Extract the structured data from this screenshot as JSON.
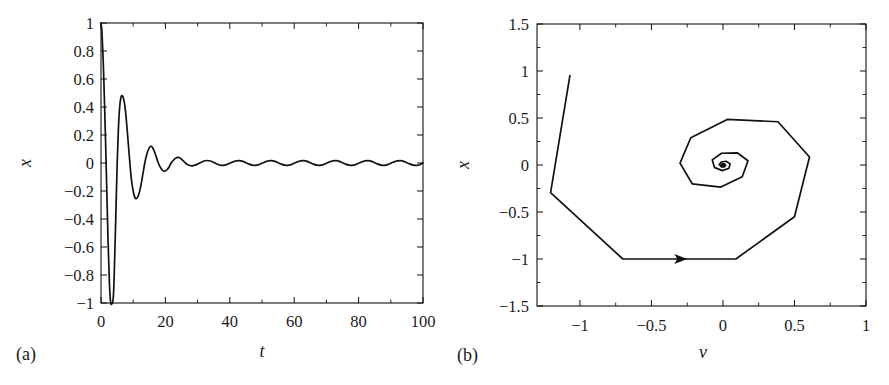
{
  "figure": {
    "background": "#ffffff",
    "line_color": "#111111",
    "text_color": "#1a1a1a"
  },
  "panels": [
    {
      "key": "a",
      "label": "(a)",
      "xlabel": "t",
      "ylabel": "x"
    },
    {
      "key": "b",
      "label": "(b)",
      "xlabel": "ν",
      "ylabel": "x"
    }
  ],
  "chart_data": [
    {
      "type": "line",
      "panel": "(a)",
      "title": "",
      "xlabel": "t",
      "ylabel": "x",
      "xlim": [
        0,
        100
      ],
      "ylim": [
        -1,
        1
      ],
      "xticks": [
        0,
        20,
        40,
        60,
        80,
        100
      ],
      "xticklabels": [
        "0",
        "20",
        "40",
        "60",
        "80",
        "100"
      ],
      "xminorticks": [
        10,
        30,
        50,
        70,
        90
      ],
      "yticks": [
        1,
        0.8,
        0.6,
        0.4,
        0.2,
        0,
        -0.2,
        -0.4,
        -0.6,
        -0.8,
        -1
      ],
      "yticklabels": [
        "1",
        "0.8",
        "0.6",
        "0.4",
        "0.2",
        "0",
        "−0.2",
        "−0.4",
        "−0.6",
        "−0.8",
        "−1"
      ],
      "grid": false,
      "legend": "none",
      "series": [
        {
          "name": "x(t)",
          "color": "#111111",
          "x": [
            0.0,
            0.3,
            0.7,
            1.0,
            1.4,
            1.8,
            2.2,
            2.6,
            3.0,
            3.3,
            3.6,
            3.9,
            4.2,
            4.6,
            5.0,
            5.4,
            5.8,
            6.2,
            6.6,
            7.0,
            7.4,
            7.9,
            8.4,
            8.9,
            9.4,
            10.0,
            10.6,
            11.2,
            11.8,
            12.4,
            13.0,
            13.6,
            14.2,
            14.8,
            15.4,
            16.0,
            16.6,
            17.2,
            17.8,
            18.4,
            19.0,
            19.7,
            20.4,
            21.1,
            21.8,
            22.5,
            23.2,
            23.9,
            24.6,
            25.3,
            26.0,
            26.8,
            27.6,
            28.4,
            29.2,
            30.0,
            31.0,
            32.0,
            33.0,
            34.0,
            35.0,
            36.0,
            37.0,
            38.0,
            39.0,
            40.0,
            41.0,
            42.0,
            43.0,
            44.0,
            45.0,
            46.0,
            47.0,
            48.0,
            49.0,
            50.0,
            51.0,
            52.0,
            53.0,
            54.0,
            55.0,
            56.0,
            57.0,
            58.0,
            59.0,
            60.0,
            61.0,
            62.0,
            63.0,
            64.0,
            65.0,
            66.0,
            67.0,
            68.0,
            69.0,
            70.0,
            71.0,
            72.0,
            73.0,
            74.0,
            75.0,
            76.0,
            77.0,
            78.0,
            79.0,
            80.0,
            81.0,
            82.0,
            83.0,
            84.0,
            85.0,
            86.0,
            87.0,
            88.0,
            89.0,
            90.0,
            91.0,
            92.0,
            93.0,
            94.0,
            95.0,
            96.0,
            97.0,
            98.0,
            99.0,
            100.0
          ],
          "y": [
            1.0,
            0.93,
            0.72,
            0.5,
            0.17,
            -0.2,
            -0.56,
            -0.85,
            -1.0,
            -1.0,
            -1.0,
            -0.93,
            -0.72,
            -0.38,
            -0.02,
            0.24,
            0.4,
            0.47,
            0.48,
            0.46,
            0.41,
            0.3,
            0.16,
            0.02,
            -0.11,
            -0.2,
            -0.25,
            -0.25,
            -0.22,
            -0.16,
            -0.08,
            0.0,
            0.06,
            0.1,
            0.12,
            0.11,
            0.08,
            0.04,
            0.0,
            -0.03,
            -0.05,
            -0.06,
            -0.05,
            -0.03,
            0.0,
            0.02,
            0.035,
            0.04,
            0.035,
            0.02,
            0.005,
            -0.01,
            -0.018,
            -0.02,
            -0.015,
            -0.008,
            0.004,
            0.014,
            0.018,
            0.014,
            0.004,
            -0.007,
            -0.015,
            -0.017,
            -0.012,
            -0.002,
            0.008,
            0.015,
            0.017,
            0.012,
            0.002,
            -0.008,
            -0.015,
            -0.017,
            -0.012,
            -0.002,
            0.008,
            0.015,
            0.017,
            0.012,
            0.002,
            -0.008,
            -0.015,
            -0.017,
            -0.012,
            -0.002,
            0.008,
            0.015,
            0.017,
            0.012,
            0.002,
            -0.008,
            -0.015,
            -0.017,
            -0.012,
            -0.002,
            0.008,
            0.015,
            0.017,
            0.012,
            0.002,
            -0.008,
            -0.015,
            -0.017,
            -0.012,
            -0.002,
            0.008,
            0.015,
            0.017,
            0.012,
            0.002,
            -0.008,
            -0.015,
            -0.017,
            -0.012,
            -0.002,
            0.008,
            0.015,
            0.017,
            0.012,
            0.002,
            -0.008,
            -0.015,
            -0.017,
            -0.012,
            0.0
          ]
        }
      ]
    },
    {
      "type": "line",
      "panel": "(b)",
      "title": "",
      "xlabel": "ν",
      "ylabel": "x",
      "xlim": [
        -1.3,
        1.0
      ],
      "ylim": [
        -1.5,
        1.5
      ],
      "xticks": [
        -1,
        -0.5,
        0,
        0.5,
        1
      ],
      "xticklabels": [
        "−1",
        "−0.5",
        "0",
        "0.5",
        "1"
      ],
      "xminorticks": [
        -0.75,
        -0.25,
        0.25,
        0.75
      ],
      "yticks": [
        1.5,
        1,
        0.5,
        0,
        -0.5,
        -1,
        -1.5
      ],
      "yticklabels": [
        "1.5",
        "1",
        "0.5",
        "0",
        "−0.5",
        "−1",
        "−1.5"
      ],
      "yminorticks": [
        1.25,
        0.75,
        0.25,
        -0.25,
        -0.75,
        -1.25
      ],
      "grid": false,
      "legend": "none",
      "annotations": [
        {
          "type": "arrow",
          "x": -0.34,
          "y": -1.0,
          "direction": "right"
        }
      ],
      "series": [
        {
          "name": "phase-trajectory",
          "color": "#111111",
          "points": [
            [
              -1.07,
              0.95
            ],
            [
              -1.205,
              -0.295
            ],
            [
              -0.7,
              -1.0
            ],
            [
              0.09,
              -1.0
            ],
            [
              0.5,
              -0.55
            ],
            [
              0.605,
              0.085
            ],
            [
              0.385,
              0.46
            ],
            [
              0.03,
              0.485
            ],
            [
              -0.225,
              0.29
            ],
            [
              -0.3,
              0.02
            ],
            [
              -0.215,
              -0.2
            ],
            [
              -0.015,
              -0.235
            ],
            [
              0.135,
              -0.125
            ],
            [
              0.175,
              0.045
            ],
            [
              0.1,
              0.13
            ],
            [
              -0.01,
              0.125
            ],
            [
              -0.075,
              0.055
            ],
            [
              -0.06,
              -0.025
            ],
            [
              -0.005,
              -0.06
            ],
            [
              0.042,
              -0.035
            ],
            [
              0.05,
              0.012
            ],
            [
              0.022,
              0.04
            ],
            [
              -0.012,
              0.032
            ],
            [
              -0.026,
              0.004
            ],
            [
              -0.012,
              -0.019
            ],
            [
              0.009,
              -0.021
            ],
            [
              0.019,
              -0.004
            ],
            [
              0.012,
              0.011
            ],
            [
              -0.002,
              0.014
            ],
            [
              -0.01,
              0.004
            ],
            [
              -0.007,
              -0.006
            ],
            [
              0.002,
              -0.009
            ],
            [
              0.008,
              -0.002
            ],
            [
              0.005,
              0.005
            ],
            [
              -0.001,
              0.006
            ],
            [
              -0.004,
              0.001
            ],
            [
              -0.002,
              -0.003
            ],
            [
              0.002,
              -0.003
            ],
            [
              0.003,
              0.0
            ],
            [
              0.001,
              0.002
            ],
            [
              0.0,
              0.001
            ]
          ]
        }
      ]
    }
  ]
}
